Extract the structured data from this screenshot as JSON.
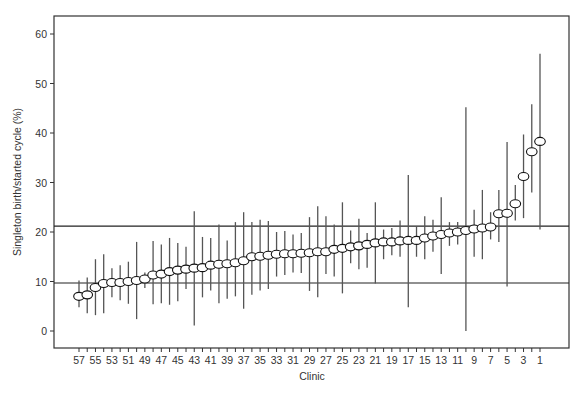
{
  "chart_data": {
    "type": "scatter",
    "subtype": "caterpillar-plot-with-error-bars",
    "title": "",
    "xlabel": "Clinic",
    "ylabel": "Singleton birth/started cycle (%)",
    "ylim": [
      -3.5,
      64
    ],
    "yticks": [
      0,
      10,
      20,
      30,
      40,
      50,
      60
    ],
    "xtick_labels": [
      "57",
      "55",
      "53",
      "51",
      "49",
      "47",
      "45",
      "43",
      "41",
      "39",
      "37",
      "35",
      "33",
      "31",
      "29",
      "27",
      "25",
      "23",
      "21",
      "19",
      "17",
      "15",
      "13",
      "11",
      "9",
      "7",
      "5",
      "3",
      "1"
    ],
    "grid": false,
    "legend": null,
    "reference_lines": [
      {
        "name": "upper-limit",
        "y": 21.2
      },
      {
        "name": "lower-limit",
        "y": 9.7
      }
    ],
    "marker": "open-ellipse",
    "clinics": [
      57,
      56,
      55,
      54,
      53,
      52,
      51,
      50,
      49,
      48,
      47,
      46,
      45,
      44,
      43,
      42,
      41,
      40,
      39,
      38,
      37,
      36,
      35,
      34,
      33,
      32,
      31,
      30,
      29,
      28,
      27,
      26,
      25,
      24,
      23,
      22,
      21,
      20,
      19,
      18,
      17,
      16,
      15,
      14,
      13,
      12,
      11,
      10,
      9,
      8,
      7,
      6,
      5,
      4,
      3,
      2,
      1
    ],
    "values": [
      7.0,
      7.3,
      8.8,
      9.6,
      9.8,
      9.8,
      10.0,
      10.2,
      10.5,
      11.3,
      11.5,
      12.0,
      12.3,
      12.5,
      12.7,
      12.8,
      13.3,
      13.5,
      13.6,
      13.8,
      14.2,
      15.0,
      15.1,
      15.3,
      15.5,
      15.6,
      15.6,
      15.7,
      15.8,
      16.0,
      16.0,
      16.5,
      16.7,
      17.0,
      17.2,
      17.5,
      17.8,
      18.0,
      18.0,
      18.2,
      18.3,
      18.3,
      18.8,
      19.2,
      19.5,
      19.8,
      20.0,
      20.3,
      20.6,
      20.8,
      21.0,
      23.7,
      23.8,
      25.7,
      31.2,
      36.2,
      38.3
    ],
    "lower": [
      4.8,
      3.6,
      3.2,
      3.6,
      6.8,
      6.2,
      5.5,
      2.4,
      8.7,
      5.4,
      5.6,
      5.3,
      6.0,
      8.5,
      1.1,
      6.8,
      8.2,
      5.6,
      6.5,
      7.0,
      4.5,
      7.3,
      8.2,
      8.5,
      11.0,
      11.3,
      11.8,
      11.7,
      8.1,
      6.8,
      11.5,
      11.0,
      7.6,
      13.7,
      12.5,
      12.8,
      9.6,
      14.5,
      15.3,
      15.0,
      4.8,
      15.0,
      14.5,
      16.0,
      11.5,
      17.2,
      17.5,
      0.0,
      15.0,
      14.5,
      18.5,
      18.0,
      9.0,
      22.3,
      22.8,
      28.0,
      20.5
    ],
    "upper": [
      10.2,
      10.8,
      14.5,
      15.5,
      12.7,
      13.3,
      14.0,
      18.0,
      11.8,
      18.2,
      17.5,
      18.8,
      17.8,
      17.0,
      24.2,
      19.0,
      18.8,
      21.5,
      18.3,
      22.0,
      24.0,
      22.0,
      22.5,
      22.2,
      20.0,
      20.2,
      19.5,
      19.8,
      23.0,
      25.2,
      23.2,
      21.5,
      26.0,
      20.3,
      22.7,
      19.8,
      26.0,
      20.5,
      20.8,
      22.3,
      31.5,
      21.2,
      23.2,
      22.5,
      27.0,
      22.0,
      22.0,
      45.2,
      24.5,
      28.5,
      24.0,
      28.5,
      38.2,
      29.5,
      39.7,
      45.8,
      56.0
    ]
  },
  "axes": {
    "x_title": "Clinic",
    "y_title": "Singleton birth/started cycle (%)",
    "y_tick_labels": [
      "0",
      "10",
      "20",
      "30",
      "40",
      "50",
      "60"
    ]
  }
}
